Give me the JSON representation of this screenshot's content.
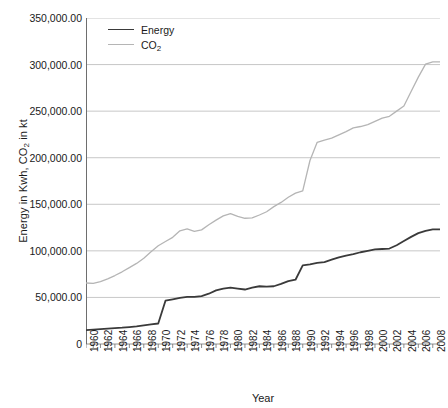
{
  "chart_data": {
    "type": "line",
    "title": "",
    "xlabel": "Year",
    "ylabel": "Energy in Kwh, CO2 in kt",
    "ylabel_parts": {
      "pre": "Energy in Kwh, CO",
      "sub": "2",
      "post": " in kt"
    },
    "xlim": [
      1960,
      2009
    ],
    "ylim": [
      0,
      350000
    ],
    "grid": true,
    "legend_position": "top-left",
    "y_ticks": [
      0,
      50000,
      100000,
      150000,
      200000,
      250000,
      300000,
      350000
    ],
    "y_tick_labels": [
      "0",
      "50,000.00",
      "100,000.00",
      "150,000.00",
      "200,000.00",
      "250,000.00",
      "300,000.00",
      "350,000.00"
    ],
    "x_ticks": [
      1960,
      1961,
      1962,
      1963,
      1964,
      1965,
      1966,
      1967,
      1968,
      1969,
      1970,
      1971,
      1972,
      1973,
      1974,
      1975,
      1976,
      1977,
      1978,
      1979,
      1980,
      1981,
      1982,
      1983,
      1984,
      1985,
      1986,
      1987,
      1988,
      1989,
      1990,
      1991,
      1992,
      1993,
      1994,
      1995,
      1996,
      1997,
      1998,
      1999,
      2000,
      2001,
      2002,
      2003,
      2004,
      2005,
      2006,
      2007,
      2008,
      2009
    ],
    "x_tick_labels": [
      "1960",
      "1962",
      "1964",
      "1966",
      "1968",
      "1970",
      "1972",
      "1974",
      "1976",
      "1978",
      "1980",
      "1982",
      "1984",
      "1986",
      "1988",
      "1990",
      "1992",
      "1994",
      "1996",
      "1998",
      "2000",
      "2002",
      "2004",
      "2006",
      "2008"
    ],
    "x_tick_label_years": [
      1960,
      1962,
      1964,
      1966,
      1968,
      1970,
      1972,
      1974,
      1976,
      1978,
      1980,
      1982,
      1984,
      1986,
      1988,
      1990,
      1992,
      1994,
      1996,
      1998,
      2000,
      2002,
      2004,
      2006,
      2008
    ],
    "x": [
      1960,
      1961,
      1962,
      1963,
      1964,
      1965,
      1966,
      1967,
      1968,
      1969,
      1970,
      1971,
      1972,
      1973,
      1974,
      1975,
      1976,
      1977,
      1978,
      1979,
      1980,
      1981,
      1982,
      1983,
      1984,
      1985,
      1986,
      1987,
      1988,
      1989,
      1990,
      1991,
      1992,
      1993,
      1994,
      1995,
      1996,
      1997,
      1998,
      1999,
      2000,
      2001,
      2002,
      2003,
      2004,
      2005,
      2006,
      2007,
      2008,
      2009
    ],
    "series": [
      {
        "name": "Energy",
        "color": "#3a3a3a",
        "width": 1.8,
        "values": [
          15000,
          15500,
          16000,
          16500,
          17000,
          17500,
          18200,
          19000,
          20000,
          21000,
          22000,
          46500,
          48000,
          49500,
          50500,
          50500,
          51500,
          54000,
          57500,
          59500,
          60500,
          59500,
          58500,
          60500,
          62000,
          61500,
          62000,
          64500,
          67500,
          69000,
          84500,
          85500,
          87000,
          88000,
          90500,
          93000,
          95000,
          96500,
          98500,
          100000,
          101500,
          102000,
          102500,
          106000,
          110500,
          115000,
          119000,
          121500,
          123000,
          123000
        ]
      },
      {
        "name": "CO2",
        "label_parts": {
          "pre": "CO",
          "sub": "2",
          "post": ""
        },
        "color": "#b5b5b5",
        "width": 1.3,
        "values": [
          65500,
          65000,
          67000,
          70000,
          73500,
          77500,
          82000,
          86500,
          92000,
          99000,
          105500,
          110000,
          114500,
          121500,
          123500,
          121000,
          122500,
          128000,
          133000,
          137500,
          140000,
          137000,
          135000,
          135500,
          138500,
          142000,
          147500,
          152000,
          157500,
          162000,
          164500,
          197000,
          216500,
          219000,
          221000,
          224500,
          228000,
          232000,
          233500,
          235500,
          239000,
          242500,
          244500,
          250000,
          255500,
          271000,
          286500,
          300500,
          303000,
          303000
        ]
      }
    ]
  }
}
